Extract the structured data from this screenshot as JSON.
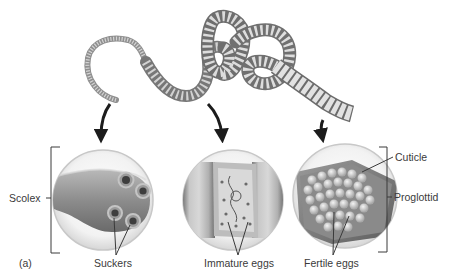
{
  "figure": {
    "panel_label": "(a)"
  },
  "labels": {
    "scolex": "Scolex",
    "suckers": "Suckers",
    "immature_eggs": "Immature eggs",
    "fertile_eggs": "Fertile eggs",
    "cuticle": "Cuticle",
    "proglottid": "Proglottid"
  },
  "colors": {
    "background": "#ffffff",
    "text": "#3a3a3a",
    "worm_light": "#e6e6e6",
    "worm_dark": "#8a8a8a",
    "lens_rim": "#cfcfcf",
    "arrow": "#1c1c1c",
    "leader_line": "#2a2a2a"
  }
}
